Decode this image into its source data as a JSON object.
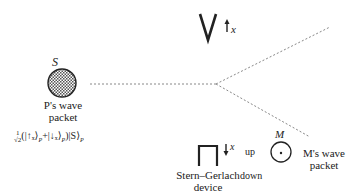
{
  "particle_S": {
    "label": "S",
    "caption_line1": "P's wave",
    "caption_line2": "packet"
  },
  "formula": {
    "prefix_num": "1",
    "prefix_den": "√2",
    "text": "(|↑ₓ⟩",
    "sub1": "P",
    "plus": "+|↓ₓ⟩",
    "sub2": "P",
    "close": ")|S⟩",
    "sub3": "P"
  },
  "magnet_top": {
    "arrow": "↑",
    "axis_label": "x"
  },
  "magnet_bottom": {
    "arrow": "↓",
    "axis_label": "x",
    "caption_line1": "Stern–Gerlach",
    "caption_line2": "device"
  },
  "measurer_M": {
    "label": "M",
    "up_label": "up",
    "down_label": "down",
    "caption_line1": "M's wave",
    "caption_line2": "packet"
  },
  "colors": {
    "line": "#222222",
    "dash": "#888888",
    "hatch": "#555555"
  }
}
